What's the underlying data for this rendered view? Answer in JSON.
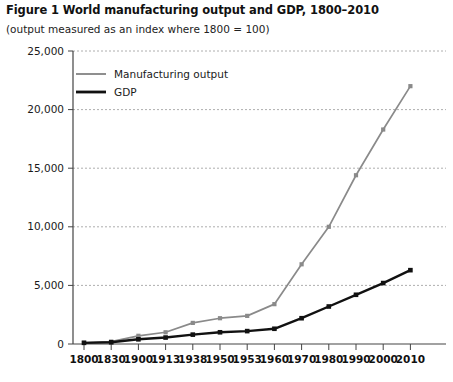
{
  "figure": {
    "title": "Figure 1 World manufacturing output and GDP, 1800–2010",
    "subtitle": "(output measured as an index where 1800 = 100)"
  },
  "colors": {
    "manufacturing": "#8a8a8a",
    "gdp": "#111111",
    "grid": "#999999",
    "axis": "#444444",
    "text": "#1a1a1a"
  },
  "legend": {
    "position": "top-left-inside",
    "entries": [
      {
        "label": "Manufacturing output",
        "color": "#8a8a8a"
      },
      {
        "label": "GDP",
        "color": "#111111"
      }
    ]
  },
  "axes": {
    "y_tick_labels": [
      "0",
      "5,000",
      "10,000",
      "15,000",
      "20,000",
      "25,000"
    ],
    "y_tick_values": [
      0,
      5000,
      10000,
      15000,
      20000,
      25000
    ],
    "x_tick_labels": [
      "1800",
      "1830",
      "1900",
      "1913",
      "1938",
      "1950",
      "1953",
      "1960",
      "1970",
      "1980",
      "1990",
      "2000",
      "2010"
    ]
  },
  "chart_data": {
    "type": "line",
    "title": "Figure 1 World manufacturing output and GDP, 1800–2010",
    "subtitle": "(output measured as an index where 1800 = 100)",
    "xlabel": "",
    "ylabel": "",
    "categories": [
      "1800",
      "1830",
      "1900",
      "1913",
      "1938",
      "1950",
      "1953",
      "1960",
      "1970",
      "1980",
      "1990",
      "2000",
      "2010"
    ],
    "series": [
      {
        "name": "Manufacturing output",
        "color": "#8a8a8a",
        "values": [
          100,
          200,
          700,
          1000,
          1800,
          2200,
          2400,
          3400,
          6800,
          10000,
          14400,
          18300,
          22000
        ]
      },
      {
        "name": "GDP",
        "color": "#111111",
        "values": [
          100,
          150,
          400,
          550,
          800,
          1000,
          1100,
          1300,
          2200,
          3200,
          4200,
          5200,
          6300
        ]
      }
    ],
    "ylim": [
      0,
      25000
    ],
    "yticks": [
      0,
      5000,
      10000,
      15000,
      20000,
      25000
    ],
    "ytick_labels": [
      "0",
      "5,000",
      "10,000",
      "15,000",
      "20,000",
      "25,000"
    ],
    "grid": "horizontal-dashed",
    "legend_position": "top-left-inside",
    "markers": true
  }
}
